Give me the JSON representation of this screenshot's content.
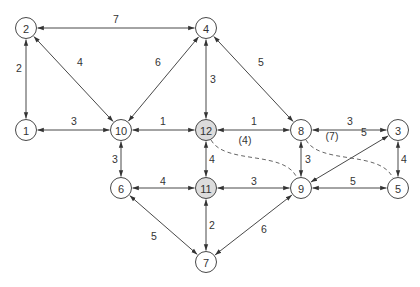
{
  "diagram": {
    "type": "weighted-undirected-graph",
    "colors": {
      "node_fill": "#ffffff",
      "highlight_fill": "#dcdcdc",
      "stroke": "#333333",
      "text": "#333333"
    },
    "nodes": [
      {
        "id": "1",
        "label": "1",
        "x": 26,
        "y": 130,
        "highlight": false
      },
      {
        "id": "2",
        "label": "2",
        "x": 26,
        "y": 28,
        "highlight": false
      },
      {
        "id": "3",
        "label": "3",
        "x": 398,
        "y": 130,
        "highlight": false
      },
      {
        "id": "4",
        "label": "4",
        "x": 206,
        "y": 28,
        "highlight": false
      },
      {
        "id": "5",
        "label": "5",
        "x": 398,
        "y": 188,
        "highlight": false
      },
      {
        "id": "6",
        "label": "6",
        "x": 121,
        "y": 188,
        "highlight": false
      },
      {
        "id": "7",
        "label": "7",
        "x": 206,
        "y": 262,
        "highlight": false
      },
      {
        "id": "8",
        "label": "8",
        "x": 301,
        "y": 130,
        "highlight": false
      },
      {
        "id": "9",
        "label": "9",
        "x": 301,
        "y": 188,
        "highlight": false
      },
      {
        "id": "10",
        "label": "10",
        "x": 121,
        "y": 130,
        "highlight": false
      },
      {
        "id": "11",
        "label": "11",
        "x": 206,
        "y": 188,
        "highlight": true
      },
      {
        "id": "12",
        "label": "12",
        "x": 206,
        "y": 130,
        "highlight": true
      }
    ],
    "edges": [
      {
        "from": "2",
        "to": "4",
        "weight": "7",
        "lx": 116,
        "ly": 19
      },
      {
        "from": "2",
        "to": "1",
        "weight": "2",
        "lx": 19,
        "ly": 68
      },
      {
        "from": "2",
        "to": "10",
        "weight": "4",
        "lx": 80,
        "ly": 62
      },
      {
        "from": "4",
        "to": "10",
        "weight": "6",
        "lx": 158,
        "ly": 62
      },
      {
        "from": "4",
        "to": "12",
        "weight": "3",
        "lx": 213,
        "ly": 79
      },
      {
        "from": "4",
        "to": "8",
        "weight": "5",
        "lx": 261,
        "ly": 62
      },
      {
        "from": "1",
        "to": "10",
        "weight": "3",
        "lx": 74,
        "ly": 121
      },
      {
        "from": "10",
        "to": "12",
        "weight": "1",
        "lx": 163,
        "ly": 121
      },
      {
        "from": "12",
        "to": "8",
        "weight": "1",
        "lx": 254,
        "ly": 121
      },
      {
        "from": "8",
        "to": "3",
        "weight": "3",
        "lx": 350,
        "ly": 121
      },
      {
        "from": "10",
        "to": "6",
        "weight": "3",
        "lx": 115,
        "ly": 159
      },
      {
        "from": "12",
        "to": "11",
        "weight": "4",
        "lx": 212,
        "ly": 159
      },
      {
        "from": "8",
        "to": "9",
        "weight": "3",
        "lx": 308,
        "ly": 159
      },
      {
        "from": "3",
        "to": "5",
        "weight": "4",
        "lx": 404,
        "ly": 159
      },
      {
        "from": "9",
        "to": "3",
        "weight": "5",
        "lx": 364,
        "ly": 132
      },
      {
        "from": "6",
        "to": "11",
        "weight": "4",
        "lx": 163,
        "ly": 181
      },
      {
        "from": "11",
        "to": "9",
        "weight": "3",
        "lx": 254,
        "ly": 181
      },
      {
        "from": "9",
        "to": "5",
        "weight": "5",
        "lx": 353,
        "ly": 181
      },
      {
        "from": "6",
        "to": "7",
        "weight": "5",
        "lx": 154,
        "ly": 236
      },
      {
        "from": "11",
        "to": "7",
        "weight": "2",
        "lx": 212,
        "ly": 225
      },
      {
        "from": "9",
        "to": "7",
        "weight": "6",
        "lx": 264,
        "ly": 229
      }
    ],
    "dashed_paths": [
      {
        "from": "12",
        "to": "9",
        "label": "(4)",
        "lx": 245,
        "ly": 140,
        "d": "M 211 140 C 225 165, 285 150, 297 178"
      },
      {
        "from": "8",
        "to": "5",
        "label": "(7)",
        "lx": 332,
        "ly": 136,
        "d": "M 306 140 C 320 165, 380 150, 393 178"
      }
    ]
  }
}
